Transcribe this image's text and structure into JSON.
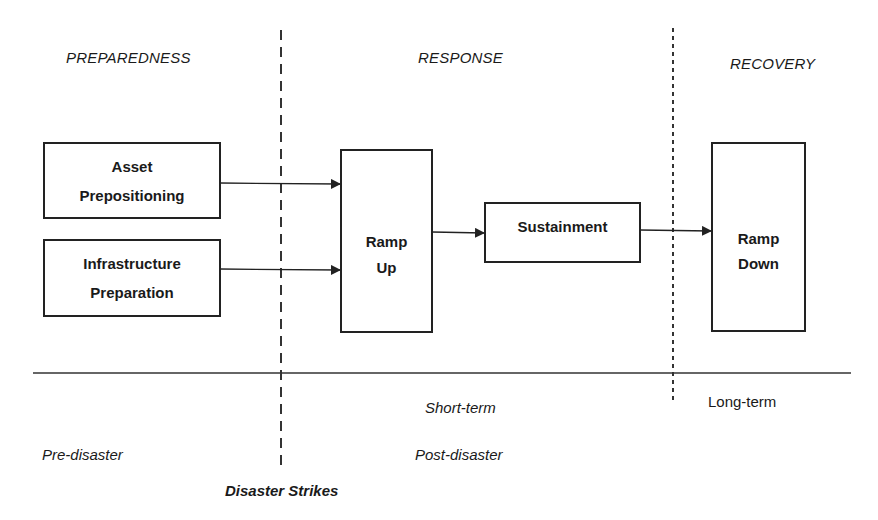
{
  "phases": {
    "preparedness": "PREPAREDNESS",
    "response": "RESPONSE",
    "recovery": "RECOVERY"
  },
  "boxes": {
    "asset_prepositioning": "Asset\nPrepositioning",
    "infrastructure_preparation": "Infrastructure\nPreparation",
    "ramp_up": "Ramp\nUp",
    "sustainment": "Sustainment",
    "ramp_down": "Ramp\nDown"
  },
  "timeline": {
    "short_term": "Short-term",
    "long_term": "Long-term",
    "pre_disaster": "Pre-disaster",
    "post_disaster": "Post-disaster",
    "disaster_strikes": "Disaster Strikes"
  },
  "colors": {
    "line": "#222222",
    "background": "#ffffff"
  }
}
